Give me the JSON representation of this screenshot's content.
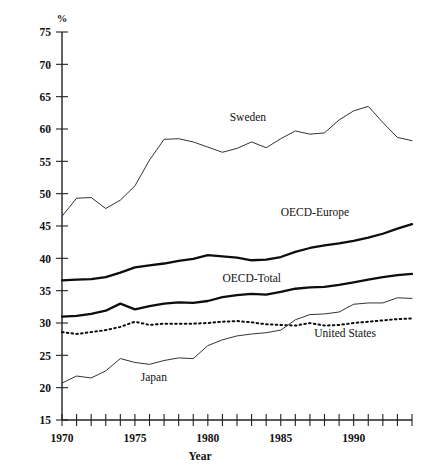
{
  "chart_data": {
    "type": "line",
    "title": "",
    "xlabel": "Year",
    "ylabel": "%",
    "unit_label": "%",
    "xlim": [
      1970,
      1994
    ],
    "ylim": [
      15,
      75
    ],
    "y_ticks": [
      15,
      20,
      25,
      30,
      35,
      40,
      45,
      50,
      55,
      60,
      65,
      70,
      75
    ],
    "y_tick_labels": [
      "15",
      "20",
      "25",
      "30",
      "35",
      "40",
      "45",
      "50",
      "55",
      "60",
      "65",
      "70",
      "75"
    ],
    "x_ticks": [
      1970,
      1971,
      1972,
      1973,
      1974,
      1975,
      1976,
      1977,
      1978,
      1979,
      1980,
      1981,
      1982,
      1983,
      1984,
      1985,
      1986,
      1987,
      1988,
      1989,
      1990,
      1991,
      1992,
      1993,
      1994
    ],
    "x_tick_labels_shown": [
      "1970",
      "1975",
      "1980",
      "1985",
      "1990"
    ],
    "x_tick_labels_shown_at": [
      1970,
      1975,
      1980,
      1985,
      1990
    ],
    "grid": false,
    "legend": "inline-annotations",
    "x": [
      1970,
      1971,
      1972,
      1973,
      1974,
      1975,
      1976,
      1977,
      1978,
      1979,
      1980,
      1981,
      1982,
      1983,
      1984,
      1985,
      1986,
      1987,
      1988,
      1989,
      1990,
      1991,
      1992,
      1993,
      1994
    ],
    "series": [
      {
        "name": "Sweden",
        "style": "thin-solid",
        "label_x": 1981.5,
        "label_y": 61.2,
        "values": [
          46.5,
          49.3,
          49.4,
          47.7,
          49.0,
          51.2,
          55.2,
          58.4,
          58.5,
          58.0,
          57.2,
          56.4,
          57.0,
          58.0,
          57.1,
          58.5,
          59.7,
          59.2,
          59.4,
          61.4,
          62.8,
          63.5,
          61.0,
          58.7,
          58.2
        ]
      },
      {
        "name": "OECD-Europe",
        "style": "thick-solid",
        "label_x": 1985.0,
        "label_y": 46.6,
        "values": [
          36.6,
          36.7,
          36.8,
          37.1,
          37.8,
          38.6,
          38.9,
          39.2,
          39.6,
          39.9,
          40.5,
          40.3,
          40.1,
          39.7,
          39.8,
          40.2,
          41.0,
          41.6,
          42.0,
          42.3,
          42.7,
          43.2,
          43.8,
          44.6,
          45.3
        ]
      },
      {
        "name": "OECD-Total",
        "style": "thick-solid",
        "label_x": 1981.0,
        "label_y": 36.3,
        "values": [
          31.0,
          31.1,
          31.4,
          31.9,
          33.0,
          32.1,
          32.6,
          33.0,
          33.2,
          33.1,
          33.4,
          34.0,
          34.3,
          34.5,
          34.4,
          34.8,
          35.3,
          35.5,
          35.6,
          35.9,
          36.3,
          36.7,
          37.1,
          37.4,
          37.6
        ]
      },
      {
        "name": "United States",
        "style": "dotted",
        "label_x": 1987.3,
        "label_y": 27.9,
        "values": [
          28.6,
          28.3,
          28.6,
          28.9,
          29.4,
          30.2,
          29.7,
          29.9,
          29.9,
          29.9,
          30.0,
          30.2,
          30.3,
          30.1,
          29.8,
          29.7,
          29.6,
          30.0,
          29.6,
          29.7,
          30.0,
          30.2,
          30.4,
          30.6,
          30.7
        ]
      },
      {
        "name": "Japan",
        "style": "thin-solid",
        "label_x": 1975.4,
        "label_y": 21.0,
        "values": [
          20.7,
          21.8,
          21.5,
          22.6,
          24.5,
          23.9,
          23.6,
          24.2,
          24.6,
          24.5,
          26.5,
          27.4,
          28.0,
          28.3,
          28.5,
          28.9,
          30.5,
          31.3,
          31.4,
          31.7,
          32.9,
          33.1,
          33.1,
          33.9,
          33.8
        ]
      }
    ]
  },
  "axes": {
    "y_unit": "%",
    "x_title": "Year"
  }
}
